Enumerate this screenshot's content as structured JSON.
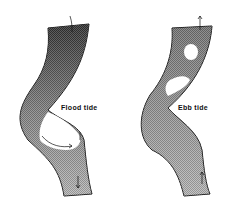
{
  "diagram": {
    "panels": [
      {
        "id": "flood",
        "label": "Flood tide"
      },
      {
        "id": "ebb",
        "label": "Ebb tide"
      }
    ],
    "colors": {
      "outline": "#111111",
      "fill_dark": "#2a2a2a",
      "fill_light": "#c8c8c8"
    }
  }
}
